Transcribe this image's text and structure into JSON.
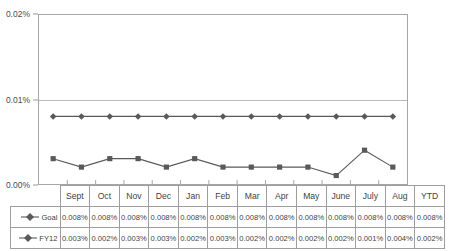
{
  "chart_data": {
    "type": "line",
    "title": "",
    "xlabel": "",
    "ylabel": "",
    "ylim": [
      0.0,
      0.02
    ],
    "ytick_labels": [
      "0.00%",
      "0.01%",
      "0.02%"
    ],
    "ytick_values": [
      0.0,
      0.01,
      0.02
    ],
    "grid": true,
    "legend_position": "data-table-left",
    "categories": [
      "Sept",
      "Oct",
      "Nov",
      "Dec",
      "Jan",
      "Feb",
      "Mar",
      "Apr",
      "May",
      "June",
      "July",
      "Aug",
      "YTD"
    ],
    "series": [
      {
        "name": "Goal",
        "marker": "diamond",
        "color": "#595959",
        "values": [
          0.008,
          0.008,
          0.008,
          0.008,
          0.008,
          0.008,
          0.008,
          0.008,
          0.008,
          0.008,
          0.008,
          0.008,
          0.008
        ],
        "labels": [
          "0.008%",
          "0.008%",
          "0.008%",
          "0.008%",
          "0.008%",
          "0.008%",
          "0.008%",
          "0.008%",
          "0.008%",
          "0.008%",
          "0.008%",
          "0.008%",
          "0.008%"
        ]
      },
      {
        "name": "FY12",
        "marker": "square",
        "color": "#595959",
        "values": [
          0.003,
          0.002,
          0.003,
          0.003,
          0.002,
          0.003,
          0.002,
          0.002,
          0.002,
          0.002,
          0.001,
          0.004,
          0.002
        ],
        "labels": [
          "0.003%",
          "0.002%",
          "0.003%",
          "0.003%",
          "0.002%",
          "0.003%",
          "0.002%",
          "0.002%",
          "0.002%",
          "0.002%",
          "0.001%",
          "0.004%",
          "0.002%"
        ]
      }
    ]
  },
  "colors": {
    "series_line": "#595959",
    "plot_border": "#a6a6a6",
    "gridline": "#b8b8b8",
    "table_border": "#9e9e9e",
    "text": "#3f3f3f",
    "background": "#ffffff"
  }
}
